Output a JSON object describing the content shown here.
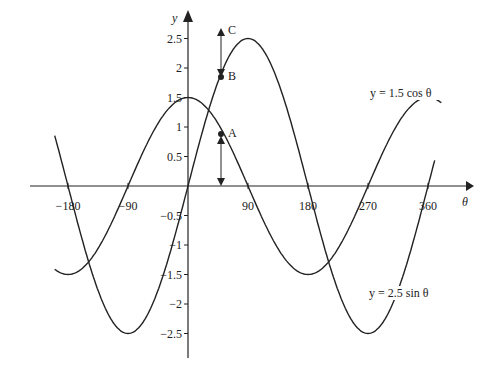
{
  "chart_data": {
    "type": "line",
    "title": "",
    "xlabel": "θ",
    "ylabel": "y",
    "x_ticks": [
      -180,
      -90,
      90,
      180,
      270,
      360
    ],
    "y_ticks": [
      2.5,
      2,
      1.5,
      1,
      0.5,
      -0.5,
      -1,
      -1.5,
      -2,
      -2.5
    ],
    "x_tick_labels": [
      "−180",
      "−90",
      "90",
      "180",
      "270",
      "360"
    ],
    "y_tick_labels": [
      "2.5",
      "2",
      "1.5",
      "1",
      "0.5",
      "−0.5",
      "−1",
      "−1.5",
      "−2",
      "−2.5"
    ],
    "xlim": [
      -200,
      380
    ],
    "ylim": [
      -2.9,
      2.8
    ],
    "grid": false,
    "series": [
      {
        "name": "y = 1.5 cos θ",
        "function": "1.5*cos(theta)",
        "domain": [
          -200,
          380
        ],
        "amplitude": 1.5
      },
      {
        "name": "y = 2.5 sin θ",
        "function": "2.5*sin(theta)",
        "domain": [
          -200,
          370
        ],
        "amplitude": 2.5
      }
    ],
    "annotations": [
      {
        "label": "A",
        "x": 55,
        "y": 0.86,
        "description": "point on 1.5 cos θ"
      },
      {
        "label": "B",
        "x": 55,
        "y": 2.05,
        "description": "point on 2.5 sin θ"
      },
      {
        "label": "C",
        "x": 55,
        "y": 2.9,
        "description": "top of arrow"
      }
    ]
  },
  "labels": {
    "y_axis": "y",
    "x_axis": "θ",
    "cos_curve": "y = 1.5 cos θ",
    "sin_curve": "y = 2.5 sin θ",
    "point_a": "A",
    "point_b": "B",
    "point_c": "C"
  }
}
